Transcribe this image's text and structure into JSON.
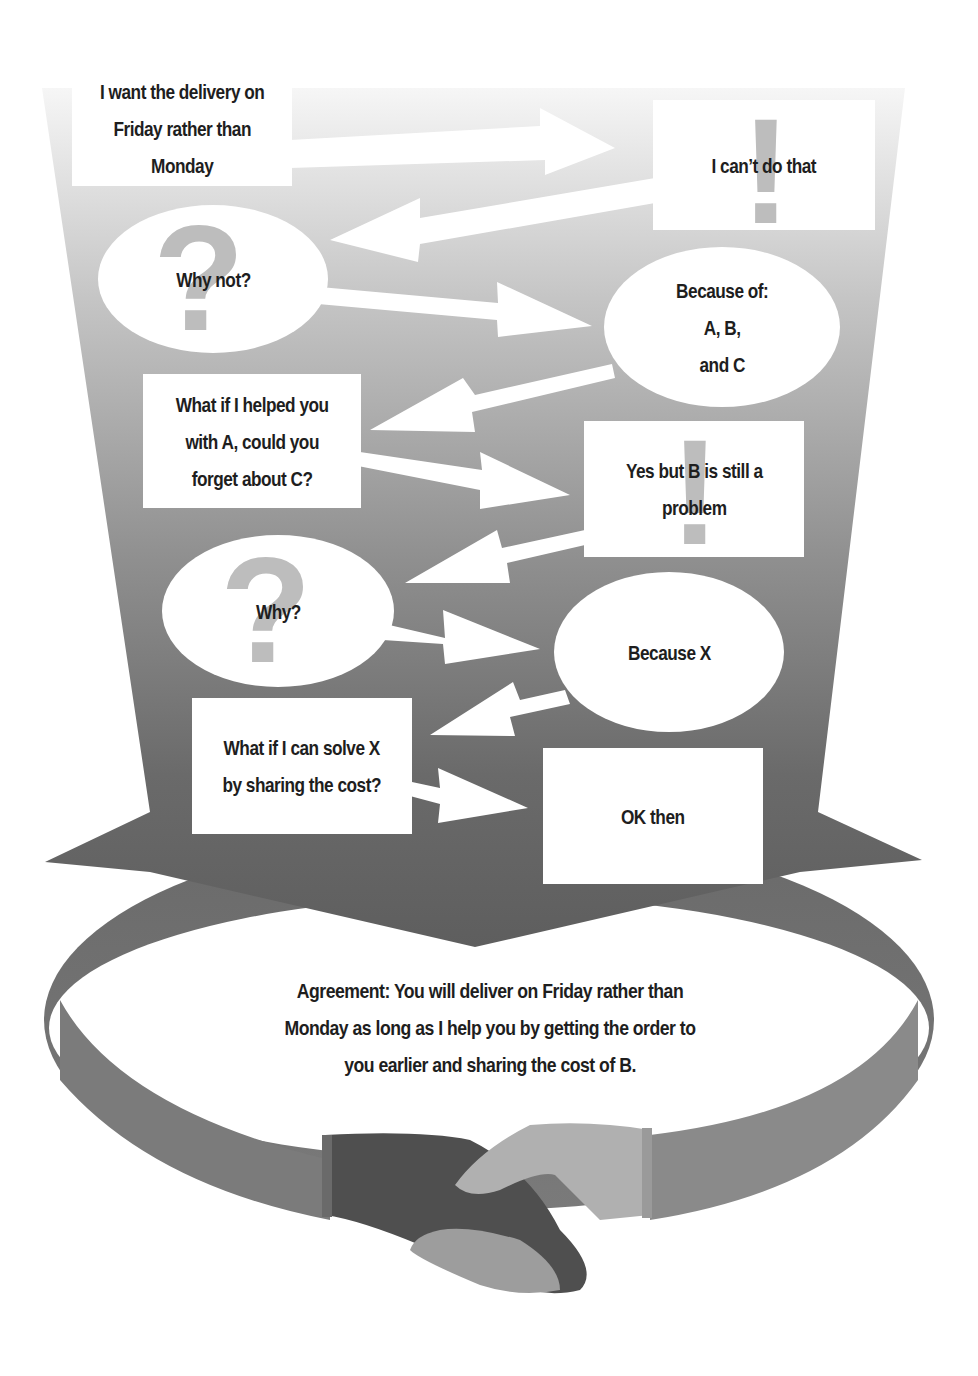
{
  "diagram": {
    "background": {
      "funnel_top_color": "#f4f4f4",
      "funnel_bottom_color": "#5f5f5f",
      "ring_color": "#676767"
    },
    "nodes": [
      {
        "id": "n1",
        "shape": "rectangle",
        "speaker": "buyer",
        "text": "I want the delivery on\nFriday rather than\nMonday",
        "icon": "none"
      },
      {
        "id": "n2",
        "shape": "rectangle",
        "speaker": "supplier",
        "text": "I can’t do that",
        "icon": "exclamation-icon"
      },
      {
        "id": "n3",
        "shape": "ellipse",
        "speaker": "buyer",
        "text": "Why not?",
        "icon": "question-icon"
      },
      {
        "id": "n4",
        "shape": "ellipse",
        "speaker": "supplier",
        "text": "Because of:\nA, B,\nand C",
        "icon": "none"
      },
      {
        "id": "n5",
        "shape": "rectangle",
        "speaker": "buyer",
        "text": "What if I helped you\nwith A, could you\nforget about C?",
        "icon": "none"
      },
      {
        "id": "n6",
        "shape": "rectangle",
        "speaker": "supplier",
        "text": "Yes but B is still a\nproblem",
        "icon": "exclamation-icon"
      },
      {
        "id": "n7",
        "shape": "ellipse",
        "speaker": "buyer",
        "text": "Why?",
        "icon": "question-icon"
      },
      {
        "id": "n8",
        "shape": "ellipse",
        "speaker": "supplier",
        "text": "Because X",
        "icon": "none"
      },
      {
        "id": "n9",
        "shape": "rectangle",
        "speaker": "buyer",
        "text": "What if I can solve X\nby sharing the cost?",
        "icon": "none"
      },
      {
        "id": "n10",
        "shape": "rectangle",
        "speaker": "supplier",
        "text": "OK then",
        "icon": "none"
      }
    ],
    "edges": [
      {
        "from": "n1",
        "to": "n2"
      },
      {
        "from": "n2",
        "to": "n3"
      },
      {
        "from": "n3",
        "to": "n4"
      },
      {
        "from": "n4",
        "to": "n5"
      },
      {
        "from": "n5",
        "to": "n6"
      },
      {
        "from": "n6",
        "to": "n7"
      },
      {
        "from": "n7",
        "to": "n8"
      },
      {
        "from": "n8",
        "to": "n9"
      },
      {
        "from": "n9",
        "to": "n10"
      }
    ],
    "agreement": {
      "text": "Agreement: You will deliver on Friday rather than\nMonday as long as I help you by getting the order to\nyou earlier and sharing the cost of B."
    },
    "illustration": "handshake-icon",
    "glyphs": {
      "question": "?",
      "exclamation": "!"
    }
  }
}
